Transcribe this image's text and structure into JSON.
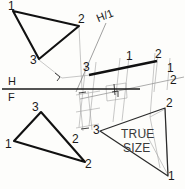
{
  "drawing": {
    "title": "Descriptive geometry: true size of an oblique plane by auxiliary views",
    "colors": {
      "object_line": "#111111",
      "construction_line": "#9a9a9a",
      "fold_line": "#1a1a1a",
      "paper": "#fdfdfb",
      "text": "#1a1a1a",
      "true_size_text": "#3a3a3a"
    },
    "fold_lines": [
      {
        "name": "h-f-fold-line",
        "upper_label": "H",
        "lower_label": "F",
        "x1": 2,
        "y1": 89,
        "x2": 140,
        "y2": 89
      },
      {
        "name": "h-1-fold-line",
        "label": "H/1",
        "x1": 76,
        "y1": 90,
        "x2": 105,
        "y2": 24
      },
      {
        "name": "one-two-fold-line",
        "label_top": "1",
        "label_bottom": "2",
        "x1": 82,
        "y1": 98,
        "x2": 183,
        "y2": 78
      }
    ],
    "views": {
      "top_view": {
        "name": "Top (horizontal) view",
        "vertices": [
          {
            "label": "1",
            "x": 13,
            "y": 11
          },
          {
            "label": "2",
            "x": 79,
            "y": 26
          },
          {
            "label": "3",
            "x": 39,
            "y": 59
          }
        ]
      },
      "front_view": {
        "name": "Front view",
        "vertices": [
          {
            "label": "3",
            "x": 41,
            "y": 112
          },
          {
            "label": "1",
            "x": 14,
            "y": 141
          },
          {
            "label": "2",
            "x": 85,
            "y": 162
          }
        ]
      },
      "edge_view": {
        "name": "First auxiliary view - edge view of plane",
        "vertices": [
          {
            "label": "3",
            "x": 91,
            "y": 74
          },
          {
            "label": "1",
            "x": 128,
            "y": 67
          },
          {
            "label": "2",
            "x": 157,
            "y": 61
          }
        ]
      },
      "true_size_view": {
        "name": "Second auxiliary view - true size",
        "caption_line1": "TRUE",
        "caption_line2": "SIZE",
        "vertices": [
          {
            "label": "3",
            "x": 100,
            "y": 131
          },
          {
            "label": "2",
            "x": 165,
            "y": 108
          },
          {
            "label": "1",
            "x": 168,
            "y": 176
          }
        ]
      }
    },
    "labels": {
      "plane_h": "H",
      "plane_f": "F",
      "fold_h1": "H/1",
      "true_size_top": "TRUE",
      "true_size_bottom": "SIZE",
      "v1": "1",
      "v2": "2",
      "v3": "3"
    },
    "annotations": [
      {
        "name": "right-angle-mark-projection",
        "type": "perpendicular-tick"
      },
      {
        "name": "right-angle-mark-auxiliary",
        "type": "perpendicular-tick"
      },
      {
        "name": "transfer-distance-ticks",
        "type": "measurement-ticks"
      }
    ]
  }
}
